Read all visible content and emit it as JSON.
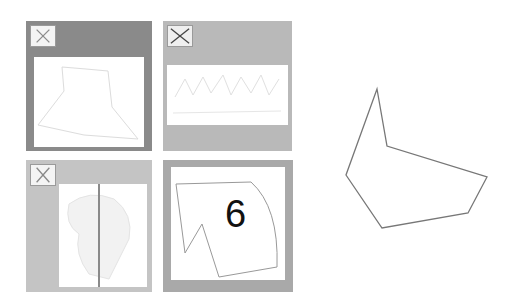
{
  "puzzle": {
    "tiles": [
      {
        "id": 1,
        "frame_color": "#8a8a8a",
        "has_close": true,
        "content": "faint-quadrilateral-outline"
      },
      {
        "id": 2,
        "frame_color": "#b9b9b9",
        "has_close": true,
        "content": "faint-zigzag-pattern"
      },
      {
        "id": 3,
        "frame_color": "#c4c4c4",
        "has_close": true,
        "content": "faint-split-sketch"
      },
      {
        "id": 4,
        "frame_color": "#a9a9a9",
        "has_close": false,
        "content": "curved-polygon-with-number",
        "label": "6"
      }
    ],
    "reference_shape": {
      "type": "hexagon-outline",
      "stroke_color": "#777777"
    }
  },
  "icons": {
    "close": "close-x-icon"
  }
}
